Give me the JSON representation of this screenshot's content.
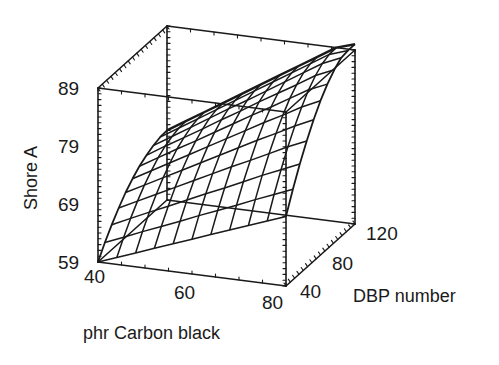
{
  "chart_data": {
    "type": "surface3d",
    "title": "",
    "xlabel": "phr Carbon black",
    "ylabel": "DBP number",
    "zlabel": "Shore A",
    "x_ticks": [
      40,
      60,
      80
    ],
    "y_ticks": [
      40,
      80,
      120
    ],
    "z_ticks": [
      59,
      69,
      79,
      89
    ],
    "xlim": [
      40,
      80
    ],
    "ylim": [
      40,
      120
    ],
    "zlim": [
      59,
      89
    ],
    "grid": false,
    "legend": null,
    "surface": {
      "x": [
        40,
        44,
        48,
        52,
        56,
        60,
        64,
        68,
        72,
        76,
        80
      ],
      "y": [
        40,
        48,
        56,
        64,
        72,
        80,
        88,
        96,
        104,
        112,
        120
      ],
      "z_corners": {
        "x40_y40": 59,
        "x80_y40": 71,
        "x40_y120": 71,
        "x80_y120": 88
      },
      "z": [
        [
          59.0,
          61.3,
          63.3,
          65.1,
          66.7,
          68.0,
          69.1,
          69.9,
          70.5,
          70.9,
          71.0
        ],
        [
          60.2,
          62.6,
          64.8,
          66.7,
          68.4,
          69.8,
          71.0,
          71.9,
          72.5,
          72.9,
          73.0
        ],
        [
          61.4,
          64.0,
          66.3,
          68.3,
          70.1,
          71.6,
          72.9,
          73.8,
          74.5,
          74.9,
          75.0
        ],
        [
          62.6,
          65.3,
          67.7,
          69.9,
          71.8,
          73.4,
          74.7,
          75.7,
          76.5,
          76.9,
          77.0
        ],
        [
          63.8,
          66.6,
          69.2,
          71.5,
          73.5,
          75.2,
          76.6,
          77.7,
          78.5,
          78.9,
          79.0
        ],
        [
          65.0,
          68.0,
          70.7,
          73.1,
          75.2,
          77.0,
          78.5,
          79.6,
          80.4,
          80.9,
          81.0
        ],
        [
          66.2,
          69.3,
          72.1,
          74.7,
          76.9,
          78.8,
          80.4,
          81.6,
          82.4,
          82.9,
          83.0
        ],
        [
          67.4,
          70.6,
          73.6,
          76.2,
          78.6,
          80.6,
          82.2,
          83.5,
          84.4,
          84.9,
          85.0
        ],
        [
          68.6,
          72.0,
          75.1,
          77.8,
          80.2,
          82.3,
          84.1,
          85.4,
          86.4,
          86.9,
          87.0
        ],
        [
          69.8,
          73.3,
          76.5,
          79.4,
          81.9,
          84.1,
          86.0,
          87.4,
          88.4,
          88.9,
          89.0
        ],
        [
          71.0,
          74.6,
          77.9,
          80.8,
          83.4,
          85.6,
          87.4,
          88.8,
          89.8,
          90.4,
          90.6
        ]
      ],
      "z_note": "rows indexed by x (40..80), columns by DBP (40..120); estimated from mesh"
    },
    "view": {
      "projection": "oblique",
      "box": true
    }
  },
  "labels": {
    "z_axis_title": "Shore A",
    "x_axis_title": "phr Carbon black",
    "y_axis_title": "DBP number",
    "z_ticks": [
      "59",
      "69",
      "79",
      "89"
    ],
    "x_ticks": [
      "40",
      "60",
      "80"
    ],
    "y_ticks": [
      "40",
      "80",
      "120"
    ]
  },
  "style": {
    "line_color": "#1a1a1a",
    "background": "#ffffff"
  }
}
